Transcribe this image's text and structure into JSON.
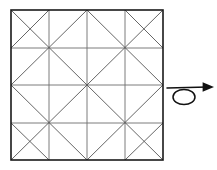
{
  "figure": {
    "canvas": {
      "width": 217,
      "height": 170,
      "background": "#ffffff"
    },
    "colors": {
      "border": "#1a1a1a",
      "grid": "#6e6e6e",
      "diagonal": "#555555",
      "arrow": "#111111"
    },
    "square": {
      "name": "outer-square",
      "x": 11,
      "y": 10,
      "width": 152,
      "height": 150,
      "stroke_width": 1.6,
      "divisions": 4
    },
    "grid": {
      "name": "inner-grid",
      "vertical_lines_x": [
        49,
        87,
        125
      ],
      "horizontal_lines_y": [
        48,
        85,
        123
      ],
      "stroke_width": 0.9
    },
    "diagonals": {
      "name": "diagonal-creases",
      "stroke_width": 0.9,
      "description": "One diagonal per cell forming continuous corner-to-corner creases with reflections",
      "segments": [
        [
          11,
          10,
          163,
          160
        ],
        [
          163,
          10,
          11,
          160
        ],
        [
          87,
          10,
          11,
          85
        ],
        [
          11,
          85,
          87,
          160
        ],
        [
          87,
          10,
          163,
          85
        ],
        [
          163,
          85,
          87,
          160
        ],
        [
          49,
          10,
          11,
          48
        ],
        [
          125,
          10,
          163,
          48
        ],
        [
          11,
          123,
          49,
          160
        ],
        [
          163,
          123,
          125,
          160
        ]
      ]
    },
    "arrow": {
      "name": "rotation-arrow",
      "label": "twist-loop-arrow",
      "loop": {
        "cx": 184,
        "cy": 97,
        "rx": 11,
        "ry": 7.5
      },
      "shaft": {
        "x1": 167,
        "y1": 88,
        "x2": 208,
        "y2": 87
      },
      "head": {
        "x": 208,
        "y": 87,
        "size": 6
      },
      "stroke_width": 1.5
    }
  }
}
